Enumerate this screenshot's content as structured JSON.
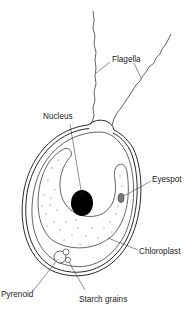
{
  "diagram": {
    "labels": {
      "flagella": "Flagella",
      "nucleus": "Nucleus",
      "eyespot": "Eyespot",
      "chloroplast": "Chloroplast",
      "pyrenoid": "Pyrenoid",
      "starch_grains": "Starch grains"
    },
    "colors": {
      "line": "#111111",
      "nucleus_fill": "#000000",
      "eyespot_fill": "#777777",
      "background": "#ffffff"
    }
  }
}
